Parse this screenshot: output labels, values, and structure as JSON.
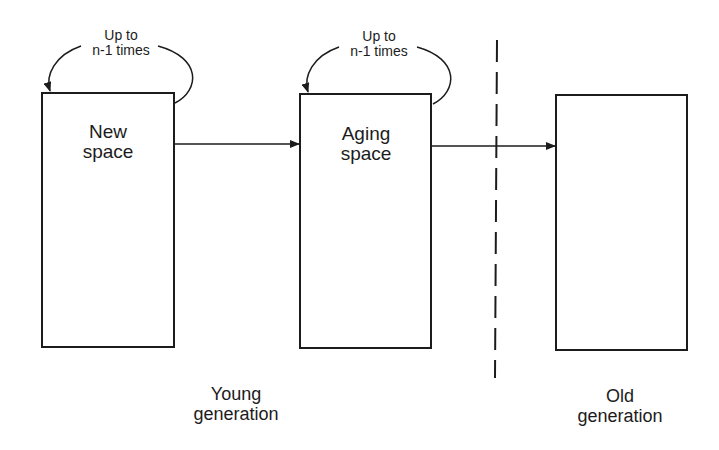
{
  "diagram": {
    "type": "generational-memory-flow",
    "stroke_color": "#1c1c1c",
    "background": "#ffffff",
    "boxes": [
      {
        "id": "new-space",
        "line1": "New",
        "line2": "space"
      },
      {
        "id": "aging-space",
        "line1": "Aging",
        "line2": "space"
      },
      {
        "id": "old-space",
        "line1": "",
        "line2": ""
      }
    ],
    "loops": [
      {
        "line1": "Up to",
        "line2": "n-1 times"
      },
      {
        "line1": "Up to",
        "line2": "n-1 times"
      }
    ],
    "arrows": [
      {
        "from": "new-space",
        "to": "aging-space"
      },
      {
        "from": "aging-space",
        "to": "old-space"
      }
    ],
    "divider": {
      "style": "dashed"
    },
    "groups": [
      {
        "line1": "Young",
        "line2": "generation"
      },
      {
        "line1": "Old",
        "line2": "generation"
      }
    ]
  }
}
